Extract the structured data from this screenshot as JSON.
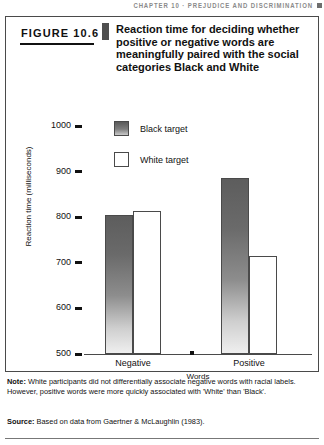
{
  "running_head": {
    "text": "CHAPTER 10 · PREJUDICE AND DISCRIMINATION",
    "marker_icon": "square-marker-icon"
  },
  "figure": {
    "label": "FIGURE 10.6",
    "title": "Reaction time for deciding whether positive or negative words are meaningfully paired with the social categories Black and White"
  },
  "note": {
    "prefix": "Note:",
    "text": " White participants did not differentially associate negative words with racial labels. However, positive words were more quickly associated with 'White' than 'Black'."
  },
  "source": {
    "prefix": "Source:",
    "text": " Based on data from Gaertner & McLaughlin (1983)."
  },
  "chart_data": {
    "type": "bar",
    "title": "Reaction time for deciding whether positive or negative words are meaningfully paired with the social categories Black and White",
    "categories": [
      "Negative",
      "Positive"
    ],
    "series": [
      {
        "name": "Black target",
        "values": [
          805,
          885
        ],
        "color": "#6f6f6f"
      },
      {
        "name": "White target",
        "values": [
          813,
          715
        ],
        "color": "#ffffff"
      }
    ],
    "xlabel": "Words",
    "ylabel": "Reaction time (milliseconds)",
    "ylim": [
      500,
      1000
    ],
    "yticks": [
      500,
      600,
      700,
      800,
      900,
      1000
    ],
    "ytick_labels": [
      "500",
      "600",
      "700",
      "800",
      "900",
      "1000"
    ],
    "grid": false,
    "legend_position": "top-center"
  }
}
